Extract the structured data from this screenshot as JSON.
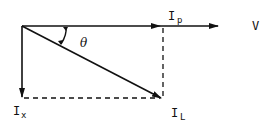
{
  "diagram": {
    "type": "phasor-diagram",
    "colors": {
      "line": "#111111",
      "background": "#ffffff"
    },
    "vectors": [
      {
        "id": "V",
        "label": "V",
        "description": "reference voltage phasor (horizontal)"
      },
      {
        "id": "I_P",
        "label": "I",
        "subscript": "p",
        "description": "in-phase component"
      },
      {
        "id": "I_L",
        "label": "I",
        "subscript": "L",
        "description": "line current, lagging by theta"
      },
      {
        "id": "I_x",
        "label": "I",
        "subscript": "x",
        "description": "quadrature component (downward)"
      }
    ],
    "angle": {
      "label": "θ"
    },
    "labels": {
      "v": "V",
      "ip_main": "I",
      "ip_sub": "p",
      "il_main": "I",
      "il_sub": "L",
      "ix_main": "I",
      "ix_sub": "x",
      "theta": "θ"
    }
  }
}
